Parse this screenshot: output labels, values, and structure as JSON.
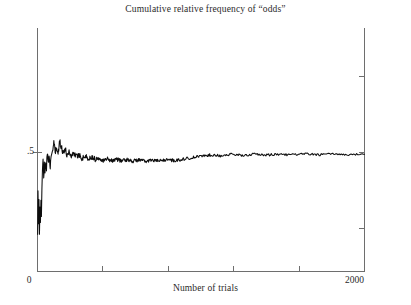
{
  "chart_data": {
    "type": "line",
    "title": "Cumulative relative frequency of “odds”",
    "xlabel": "Number of trials",
    "ylabel": "",
    "xlim": [
      0,
      2000
    ],
    "ylim": [
      0,
      1
    ],
    "grid": false,
    "legend": null,
    "x_tick_labels": [
      "0",
      "2000"
    ],
    "y_tick_labels": [
      ".5"
    ],
    "y_tick_values": [
      0.5
    ],
    "x_minor_tick_values": [
      400,
      800,
      1200,
      1600
    ],
    "series": [
      {
        "name": "Cumulative relative frequency of odds",
        "color": "#0d0d0d",
        "x": [
          1,
          3,
          6,
          9,
          12,
          15,
          18,
          21,
          24,
          27,
          30,
          34,
          38,
          42,
          46,
          50,
          55,
          60,
          66,
          72,
          78,
          85,
          92,
          100,
          108,
          117,
          126,
          136,
          146,
          157,
          168,
          180,
          193,
          207,
          222,
          238,
          255,
          273,
          292,
          312,
          333,
          355,
          378,
          402,
          428,
          455,
          484,
          515,
          548,
          583,
          620,
          659,
          700,
          744,
          790,
          838,
          889,
          942,
          998,
          1057,
          1119,
          1184,
          1252,
          1323,
          1397,
          1474,
          1554,
          1637,
          1723,
          1812,
          1904,
          2000
        ],
        "y": [
          0.15,
          0.33,
          0.19,
          0.29,
          0.17,
          0.28,
          0.2,
          0.3,
          0.235,
          0.345,
          0.42,
          0.465,
          0.405,
          0.45,
          0.41,
          0.47,
          0.435,
          0.5,
          0.455,
          0.495,
          0.44,
          0.48,
          0.505,
          0.545,
          0.5,
          0.515,
          0.495,
          0.545,
          0.525,
          0.5,
          0.515,
          0.49,
          0.505,
          0.485,
          0.5,
          0.482,
          0.492,
          0.475,
          0.486,
          0.472,
          0.482,
          0.47,
          0.478,
          0.468,
          0.474,
          0.466,
          0.472,
          0.465,
          0.47,
          0.464,
          0.469,
          0.463,
          0.468,
          0.464,
          0.47,
          0.466,
          0.472,
          0.478,
          0.484,
          0.49,
          0.487,
          0.492,
          0.488,
          0.493,
          0.489,
          0.493,
          0.49,
          0.494,
          0.491,
          0.494,
          0.491,
          0.493
        ]
      }
    ]
  },
  "axes": {
    "title": "Cumulative relative frequency of “odds”",
    "x_label": "Number of trials",
    "x_min_label": "0",
    "x_max_label": "2000",
    "y_tick_label": ".5"
  }
}
